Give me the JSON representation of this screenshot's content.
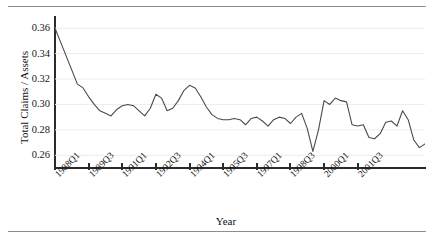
{
  "chart_data": {
    "type": "line",
    "title": "",
    "xlabel": "Year",
    "ylabel": "Total Claims / Assets",
    "ylim": [
      0.25,
      0.368
    ],
    "yticks": [
      0.26,
      0.28,
      0.3,
      0.32,
      0.34,
      0.36
    ],
    "ytick_labels": [
      "0.26",
      "0.28",
      "0.30",
      "0.32",
      "0.34",
      "0.36"
    ],
    "grid": "horizontal-faint",
    "legend": "none",
    "line_color": "#4a4a4a",
    "axis_color": "#2b2b2b",
    "xtick_labels": [
      "1988Q1",
      "1989Q3",
      "1991Q1",
      "1992Q3",
      "1994Q1",
      "1995Q3",
      "1997Q1",
      "1998Q3",
      "2000Q1",
      "2001Q3"
    ],
    "xtick_indices": [
      0,
      6,
      12,
      18,
      24,
      30,
      36,
      42,
      48,
      54
    ],
    "x": [
      "1988Q1",
      "1988Q2",
      "1988Q3",
      "1988Q4",
      "1989Q1",
      "1989Q2",
      "1989Q3",
      "1989Q4",
      "1990Q1",
      "1990Q2",
      "1990Q3",
      "1990Q4",
      "1991Q1",
      "1991Q2",
      "1991Q3",
      "1991Q4",
      "1992Q1",
      "1992Q2",
      "1992Q3",
      "1992Q4",
      "1993Q1",
      "1993Q2",
      "1993Q3",
      "1993Q4",
      "1994Q1",
      "1994Q2",
      "1994Q3",
      "1994Q4",
      "1995Q1",
      "1995Q2",
      "1995Q3",
      "1995Q4",
      "1996Q1",
      "1996Q2",
      "1996Q3",
      "1996Q4",
      "1997Q1",
      "1997Q2",
      "1997Q3",
      "1997Q4",
      "1998Q1",
      "1998Q2",
      "1998Q3",
      "1998Q4",
      "1999Q1",
      "1999Q2",
      "1999Q3",
      "1999Q4",
      "2000Q1",
      "2000Q2",
      "2000Q3",
      "2000Q4",
      "2001Q1",
      "2001Q2",
      "2001Q3",
      "2001Q4"
    ],
    "values": [
      0.36,
      0.349,
      0.338,
      0.327,
      0.316,
      0.313,
      0.306,
      0.3,
      0.295,
      0.293,
      0.291,
      0.296,
      0.299,
      0.3,
      0.299,
      0.295,
      0.291,
      0.297,
      0.308,
      0.305,
      0.295,
      0.297,
      0.303,
      0.311,
      0.315,
      0.313,
      0.306,
      0.298,
      0.292,
      0.289,
      0.288,
      0.288,
      0.289,
      0.288,
      0.284,
      0.289,
      0.29,
      0.287,
      0.283,
      0.288,
      0.29,
      0.289,
      0.285,
      0.29,
      0.293,
      0.281,
      0.263,
      0.28,
      0.303,
      0.3,
      0.305,
      0.303,
      0.302,
      0.284,
      0.283,
      0.284
    ],
    "values_tail": [
      0.274,
      0.273,
      0.277,
      0.286,
      0.287,
      0.283,
      0.295,
      0.288,
      0.272,
      0.266,
      0.269
    ]
  },
  "figure": {
    "caption_top": "",
    "caption_bottom": ""
  }
}
